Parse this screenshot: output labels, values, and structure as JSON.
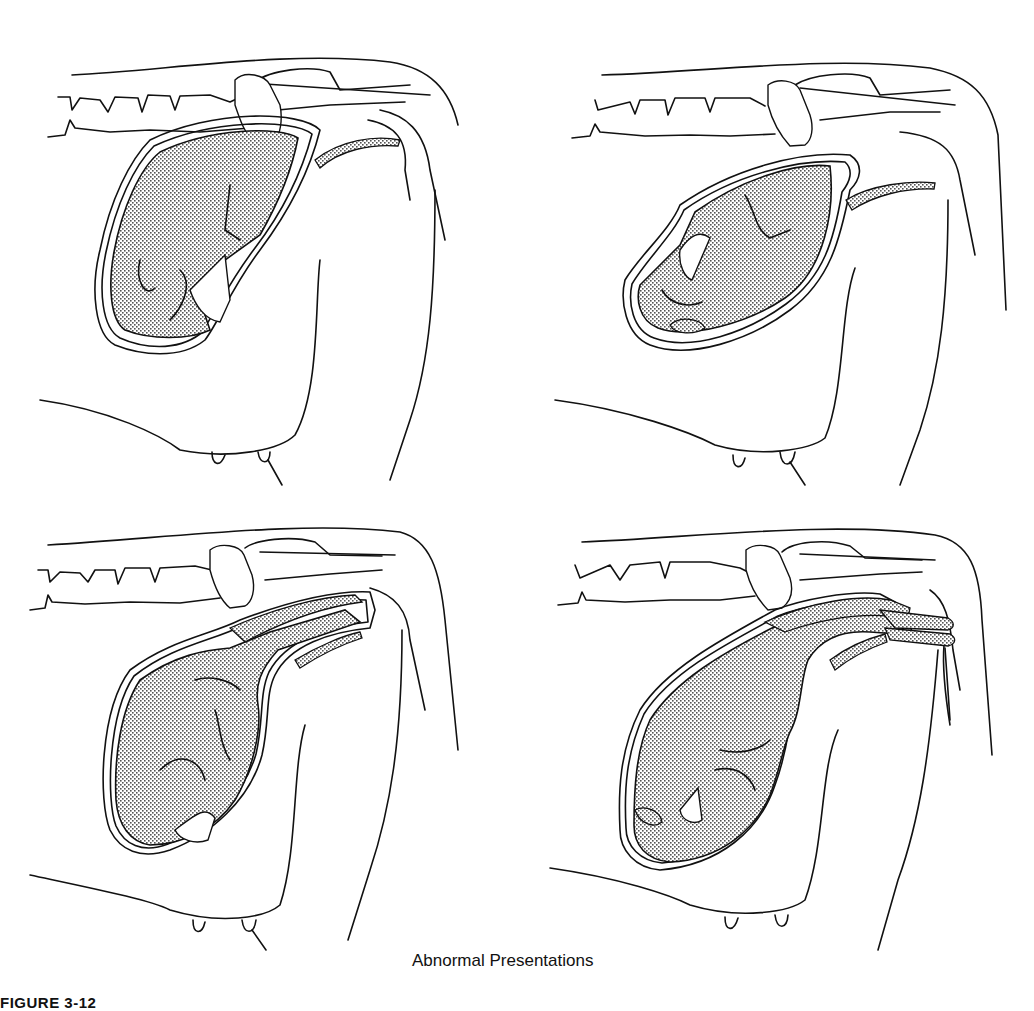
{
  "figure": {
    "label": "FIGURE 3-12",
    "caption": "Abnormal Presentations",
    "panels": [
      {
        "id": "panel-1",
        "position": "top-left",
        "description": "calf curled with head and limbs turned back inside uterus"
      },
      {
        "id": "panel-2",
        "position": "top-right",
        "description": "calf lying transversely with limbs folded"
      },
      {
        "id": "panel-3",
        "position": "bottom-left",
        "description": "calf with forelimbs extended toward birth canal, head turned back"
      },
      {
        "id": "panel-4",
        "position": "bottom-right",
        "description": "calf with forelimbs extended through birth canal, head turned down"
      }
    ],
    "colors": {
      "ink": "#111111",
      "background": "#ffffff",
      "stipple": "#555555"
    }
  }
}
